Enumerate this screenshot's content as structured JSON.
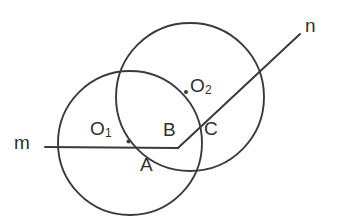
{
  "figure": {
    "background_color": "#ffffff",
    "stroke_color": "#3b3b3b",
    "text_color": "#2f2f2f",
    "width": 338,
    "height": 220
  },
  "labels": {
    "line_m": "m",
    "line_n": "n",
    "center_one": "O",
    "center_one_sub": "1",
    "center_two": "O",
    "center_two_sub": "2",
    "point_a": "A",
    "point_b": "B",
    "point_c": "C"
  },
  "geometry": {
    "circle_one": {
      "cx": 130,
      "cy": 143,
      "r": 72
    },
    "circle_two": {
      "cx": 190,
      "cy": 97,
      "r": 74
    },
    "center_dot_one": {
      "cx": 128.5,
      "cy": 141.5,
      "r": 2.0
    },
    "center_dot_two": {
      "cx": 186.0,
      "cy": 92.0,
      "r": 2.0
    },
    "line_m": {
      "x1": 45,
      "y1": 147,
      "x2": 178,
      "y2": 148
    },
    "line_n": {
      "x1": 178,
      "y1": 148,
      "x2": 300,
      "y2": 34
    }
  },
  "chart_data": {
    "type": "scatter",
    "xlabel": "",
    "ylabel": "",
    "xlim": [
      0,
      338
    ],
    "ylim": [
      0,
      220
    ],
    "grid": false,
    "legend": "none",
    "annotations": [
      {
        "text": "m",
        "x": 20,
        "y": 143,
        "role": "line-label"
      },
      {
        "text": "n",
        "x": 311,
        "y": 26,
        "role": "line-label"
      },
      {
        "text": "O1",
        "x": 101,
        "y": 130,
        "role": "center-label"
      },
      {
        "text": "O2",
        "x": 201,
        "y": 87,
        "role": "center-label"
      },
      {
        "text": "A",
        "x": 147,
        "y": 166,
        "role": "point-label"
      },
      {
        "text": "B",
        "x": 169,
        "y": 131,
        "role": "point-label"
      },
      {
        "text": "C",
        "x": 211,
        "y": 130,
        "role": "point-label"
      }
    ],
    "shapes": [
      {
        "kind": "circle",
        "name": "circle-O1",
        "cx": 130,
        "cy": 143,
        "r": 72
      },
      {
        "kind": "circle",
        "name": "circle-O2",
        "cx": 190,
        "cy": 97,
        "r": 74
      },
      {
        "kind": "point",
        "name": "center-O1",
        "x": 128.5,
        "y": 141.5
      },
      {
        "kind": "point",
        "name": "center-O2",
        "x": 186.0,
        "y": 92.0
      },
      {
        "kind": "segment",
        "name": "line-m",
        "x1": 45,
        "y1": 147,
        "x2": 178,
        "y2": 148
      },
      {
        "kind": "segment",
        "name": "line-n",
        "x1": 178,
        "y1": 148,
        "x2": 300,
        "y2": 34
      }
    ]
  }
}
